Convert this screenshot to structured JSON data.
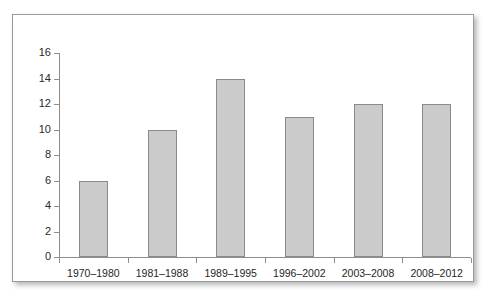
{
  "chart_data": {
    "type": "bar",
    "title": "",
    "subtitle": "",
    "xlabel": "",
    "ylabel": "",
    "categories": [
      "1970–1980",
      "1981–1988",
      "1989–1995",
      "1996–2002",
      "2003–2008",
      "2008–2012"
    ],
    "values": [
      6,
      10,
      14,
      11,
      12,
      12
    ],
    "ylim": [
      0,
      16
    ],
    "ytick_labels": [
      "0",
      "2",
      "4",
      "6",
      "8",
      "10",
      "12",
      "14",
      "16"
    ],
    "ytick_values": [
      0,
      2,
      4,
      6,
      8,
      10,
      12,
      14,
      16
    ],
    "grid": false,
    "legend": null,
    "legend_position": "none",
    "annotations": [],
    "colors": {
      "bar_fill": "#cbcbcb",
      "bar_border": "#8a8a8a",
      "axis": "#8e8e8e",
      "text": "#1f1f1f",
      "panel_background": "#ffffff",
      "panel_border": "#9a9a9a",
      "page_background": "#ffffff"
    }
  }
}
